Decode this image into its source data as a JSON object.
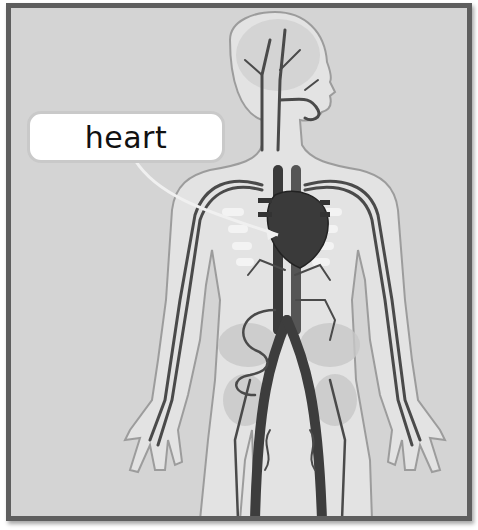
{
  "diagram": {
    "labels": [
      {
        "text": "heart",
        "target": "heart"
      }
    ],
    "colors": {
      "frame": "#5e5e5e",
      "background": "#d4d4d4",
      "body": "#e6e6e6",
      "body_outline": "#9a9a9a",
      "vessel": "#4a4a4a",
      "heart": "#3a3a3a",
      "bone": "#f4f4f4",
      "label_bg": "#ffffff",
      "label_text": "#111111",
      "leader_line": "#eeeeee"
    }
  }
}
